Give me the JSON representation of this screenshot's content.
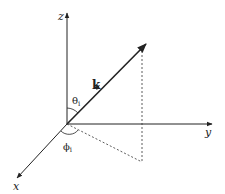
{
  "diagram": {
    "axes": {
      "z_label": "z",
      "y_label": "y",
      "x_label": "x"
    },
    "vector": {
      "label": "k"
    },
    "angles": {
      "theta_symbol": "θ",
      "theta_sub": "i",
      "phi_symbol": "ϕ",
      "phi_sub": "i"
    },
    "colors": {
      "line": "#222222",
      "background": "#ffffff"
    }
  }
}
